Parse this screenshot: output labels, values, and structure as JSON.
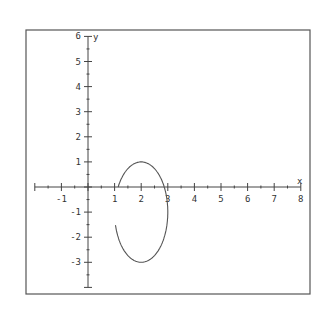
{
  "chart_data": {
    "type": "line",
    "title": "",
    "xlabel": "x",
    "ylabel": "y",
    "xlim": [
      -2,
      8
    ],
    "ylim": [
      -4,
      6
    ],
    "grid": false,
    "legend": null,
    "x_ticks": [
      -1,
      1,
      2,
      3,
      4,
      5,
      6,
      7,
      8
    ],
    "y_ticks": [
      6,
      5,
      4,
      3,
      2,
      1,
      -1,
      -2,
      -3
    ],
    "x_tick_labels": [
      "-1",
      "1",
      "2",
      "3",
      "4",
      "5",
      "6",
      "7",
      "8"
    ],
    "y_tick_labels": [
      "6",
      "5",
      "4",
      "3",
      "2",
      "1",
      "-1",
      "-2",
      "-3"
    ],
    "minor_tick_step": 0.5,
    "series": [
      {
        "name": "ellipse arc",
        "description": "Ellipse centered at (2,-1) with horizontal radius 1 and vertical radius 2; drawn as an open arc with a gap on the left side between y≈0 and y≈-1.3",
        "center": [
          2,
          -1
        ],
        "rx": 1,
        "ry": 2,
        "start_angle_deg": 150,
        "end_angle_deg": 195,
        "key_points": [
          {
            "x": 1.05,
            "y": 0.0
          },
          {
            "x": 2,
            "y": 1
          },
          {
            "x": 3,
            "y": -1
          },
          {
            "x": 2,
            "y": -3
          },
          {
            "x": 1.02,
            "y": -1.3
          }
        ]
      }
    ]
  },
  "frame": {
    "border_color": "#555555",
    "axis_color": "#444444",
    "curve_color": "#555555",
    "text_color": "#333333"
  }
}
